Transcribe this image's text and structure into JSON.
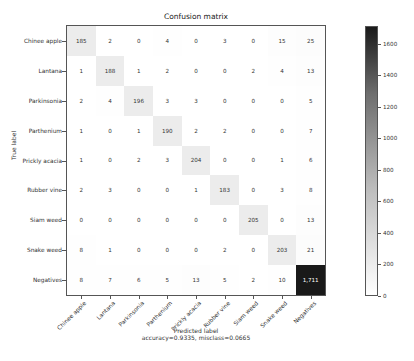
{
  "chart_data": {
    "type": "heatmap",
    "title": "Confusion matrix",
    "xlabel": "Predicted label",
    "xlabel_note": "accuracy=0.9335, misclass=0.0665",
    "ylabel": "True label",
    "classes": [
      "Chinee apple",
      "Lantana",
      "Parkinsonia",
      "Parthenium",
      "Prickly acacia",
      "Rubber vine",
      "Siam weed",
      "Snake weed",
      "Negatives"
    ],
    "matrix": [
      [
        185,
        2,
        0,
        4,
        0,
        3,
        0,
        15,
        25
      ],
      [
        1,
        188,
        1,
        2,
        0,
        0,
        2,
        4,
        13
      ],
      [
        2,
        4,
        196,
        3,
        3,
        0,
        0,
        0,
        5
      ],
      [
        1,
        0,
        1,
        190,
        2,
        2,
        0,
        0,
        7
      ],
      [
        1,
        0,
        2,
        3,
        204,
        0,
        0,
        1,
        6
      ],
      [
        2,
        3,
        0,
        0,
        1,
        183,
        0,
        3,
        8
      ],
      [
        0,
        0,
        0,
        0,
        0,
        0,
        205,
        0,
        13
      ],
      [
        8,
        1,
        0,
        0,
        0,
        2,
        0,
        203,
        21
      ],
      [
        8,
        7,
        6,
        5,
        13,
        5,
        2,
        10,
        1711
      ]
    ],
    "matrix_display": [
      [
        "185",
        "2",
        "0",
        "4",
        "0",
        "3",
        "0",
        "15",
        "25"
      ],
      [
        "1",
        "188",
        "1",
        "2",
        "0",
        "0",
        "2",
        "4",
        "13"
      ],
      [
        "2",
        "4",
        "196",
        "3",
        "3",
        "0",
        "0",
        "0",
        "5"
      ],
      [
        "1",
        "0",
        "1",
        "190",
        "2",
        "2",
        "0",
        "0",
        "7"
      ],
      [
        "1",
        "0",
        "2",
        "3",
        "204",
        "0",
        "0",
        "1",
        "6"
      ],
      [
        "2",
        "3",
        "0",
        "0",
        "1",
        "183",
        "0",
        "3",
        "8"
      ],
      [
        "0",
        "0",
        "0",
        "0",
        "0",
        "0",
        "205",
        "0",
        "13"
      ],
      [
        "8",
        "1",
        "0",
        "0",
        "0",
        "2",
        "0",
        "203",
        "21"
      ],
      [
        "8",
        "7",
        "6",
        "5",
        "13",
        "5",
        "2",
        "10",
        "1,711"
      ]
    ],
    "colorbar": {
      "min": 0,
      "max": 1711,
      "ticks": [
        "0",
        "200",
        "400",
        "600",
        "800",
        "1000",
        "1200",
        "1400",
        "1600"
      ],
      "colormap": "Greys"
    }
  },
  "caption_partial": "FIGURE 3.4 ..."
}
